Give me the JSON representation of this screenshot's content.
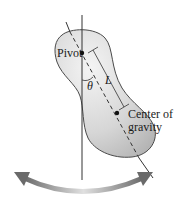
{
  "diagram": {
    "labels": {
      "pivot": "Pivot",
      "length": "L",
      "angle": "θ",
      "cog_line1": "Center of",
      "cog_line2": "gravity"
    },
    "colors": {
      "body_fill_light": "#f2f2f2",
      "body_fill_dark": "#bdbdbd",
      "body_stroke": "#555555",
      "line": "#333333",
      "arrow_light": "#d8d8d8",
      "arrow_dark": "#6a6a6a"
    },
    "elements": [
      "irregular-body",
      "vertical-reference-line",
      "dashed-axis-line",
      "pivot-point",
      "center-of-gravity-point",
      "length-dimension-L",
      "angle-arc-theta",
      "swing-double-arrow"
    ]
  }
}
